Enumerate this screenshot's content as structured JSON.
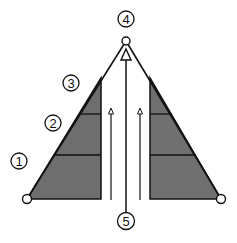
{
  "diagram": {
    "type": "triangular truss / A-frame schematic",
    "colors": {
      "stroke": "#111111",
      "fill": "#6e6e6e",
      "background": "#ffffff"
    },
    "labels": [
      {
        "id": "1",
        "text": "1"
      },
      {
        "id": "2",
        "text": "2"
      },
      {
        "id": "3",
        "text": "3"
      },
      {
        "id": "4",
        "text": "4"
      },
      {
        "id": "5",
        "text": "5"
      }
    ]
  }
}
